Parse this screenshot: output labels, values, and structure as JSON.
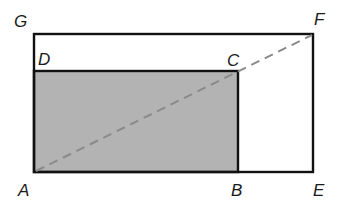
{
  "diagram": {
    "colors": {
      "stroke": "#111111",
      "shade": "#b3b3b3",
      "dashed_line": "#8a8a8a",
      "background": "#ffffff"
    },
    "points": {
      "A": {
        "label": "A",
        "x": 34,
        "y": 172
      },
      "B": {
        "label": "B",
        "x": 238,
        "y": 172
      },
      "C": {
        "label": "C",
        "x": 238,
        "y": 71
      },
      "D": {
        "label": "D",
        "x": 34,
        "y": 71
      },
      "E": {
        "label": "E",
        "x": 313,
        "y": 172
      },
      "F": {
        "label": "F",
        "x": 313,
        "y": 34
      },
      "G": {
        "label": "G",
        "x": 34,
        "y": 34
      }
    },
    "shapes": {
      "shaded_rectangle": "ABCD",
      "outer_rectangle": "AEFG",
      "dashed_segment": "AF"
    }
  }
}
